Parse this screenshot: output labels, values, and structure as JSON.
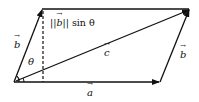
{
  "diagram": {
    "type": "parallelogram-vector-diagram",
    "labels": {
      "vector_a": "a",
      "vector_b_left": "b",
      "vector_b_right": "b",
      "vector_c": "c",
      "angle": "θ",
      "height_norm_open": "||",
      "height_norm_vec": "b",
      "height_norm_close": "|| sin θ"
    },
    "colors": {
      "stroke": "#111111",
      "background": "#ffffff"
    },
    "points": {
      "origin": [
        14,
        82
      ],
      "b_tip": [
        42,
        9
      ],
      "c_tip": [
        190,
        9
      ],
      "a_tip": [
        160,
        82
      ]
    }
  }
}
